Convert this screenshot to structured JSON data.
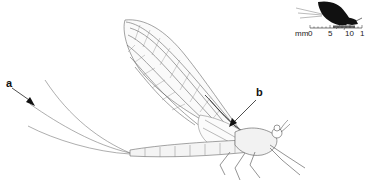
{
  "figure": {
    "labels": {
      "a": "a",
      "b": "b"
    },
    "scale_bar": {
      "unit": "mm",
      "ticks": [
        "0",
        "5",
        "10",
        "1"
      ]
    },
    "colors": {
      "line": "#555555",
      "silhouette": "#111111",
      "scale_fill": "#666666",
      "background": "#ffffff"
    }
  }
}
